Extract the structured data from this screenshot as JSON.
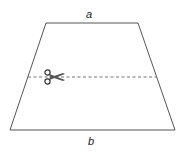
{
  "diagram": {
    "shape": "trapezoid",
    "labels": {
      "top": "a",
      "bottom": "b"
    },
    "cut_line": {
      "style": "dashed",
      "icon": "scissors-icon"
    },
    "colors": {
      "stroke": "#555555",
      "dash": "#777777",
      "background": "#ffffff"
    }
  }
}
